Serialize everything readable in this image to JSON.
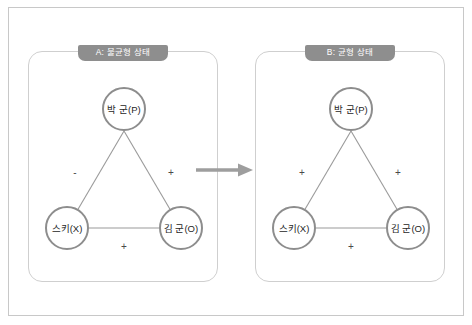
{
  "figure": {
    "background_color": "#ffffff",
    "frame_color": "#c8c8c8",
    "panel_border_color": "#cfcfcf",
    "title_tag_color": "#8e8e8e",
    "node_ring_color": "#8d8d8d",
    "edge_color": "#9a9a9a",
    "arrow_color": "#9e9e9e",
    "sign_text_color": "#4a4a4a"
  },
  "panels": [
    {
      "id": "panel-a",
      "title": "A: 불균형 상태",
      "nodes": {
        "top": "박 군(P)",
        "bottom_left": "스키(X)",
        "bottom_right": "김 군(O)"
      },
      "edges": {
        "top_to_bottom_left": "-",
        "top_to_bottom_right": "+",
        "bottom_left_to_bottom_right": "+"
      }
    },
    {
      "id": "panel-b",
      "title": "B: 균형 상태",
      "nodes": {
        "top": "박 군(P)",
        "bottom_left": "스키(X)",
        "bottom_right": "김 군(O)"
      },
      "edges": {
        "top_to_bottom_left": "+",
        "top_to_bottom_right": "+",
        "bottom_left_to_bottom_right": "+"
      }
    }
  ],
  "transition": {
    "icon": "right-arrow-icon",
    "label": ""
  }
}
